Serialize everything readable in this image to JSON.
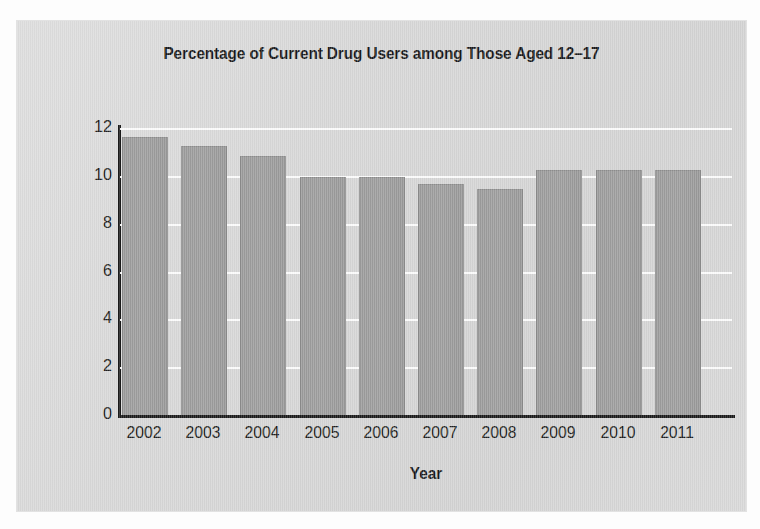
{
  "chart_data": {
    "type": "bar",
    "title": "Percentage of Current Drug Users among Those Aged 12–17",
    "xlabel": "Year",
    "ylabel": "",
    "categories": [
      "2002",
      "2003",
      "2004",
      "2005",
      "2006",
      "2007",
      "2008",
      "2009",
      "2010",
      "2011"
    ],
    "values": [
      11.6,
      11.2,
      10.8,
      9.9,
      9.9,
      9.6,
      9.4,
      10.2,
      10.2,
      10.2
    ],
    "ylim": [
      0,
      12
    ],
    "ytick_labels": [
      "0",
      "2",
      "4",
      "6",
      "8",
      "10",
      "12"
    ],
    "ytick_values": [
      0,
      2,
      4,
      6,
      8,
      10,
      12
    ],
    "grid": "horizontal",
    "legend": "none",
    "series": [
      {
        "name": "Percentage of current drug users",
        "values": [
          11.6,
          11.2,
          10.8,
          9.9,
          9.9,
          9.6,
          9.4,
          10.2,
          10.2,
          10.2
        ]
      }
    ],
    "colors": {
      "bar_fill": "#9a9a9a",
      "bar_edge": "#8a8a8a",
      "gridline": "#fdfdfd",
      "axis": "#1a1a1a",
      "plot_background": "#d6d6d6",
      "text": "#1d1e20"
    }
  }
}
